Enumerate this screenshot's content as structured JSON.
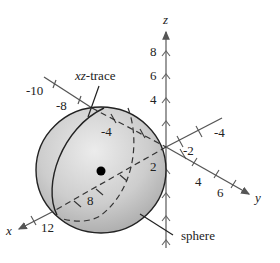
{
  "figure": {
    "type": "3d-coordinate-diagram",
    "labels": {
      "xz_trace": "xz-trace",
      "sphere": "sphere"
    },
    "axes": {
      "x": {
        "label": "x",
        "ticks": [
          "-10",
          "-8",
          "-4",
          "2",
          "8",
          "12"
        ]
      },
      "y": {
        "label": "y",
        "ticks": [
          "-4",
          "-2",
          "2",
          "4",
          "6"
        ]
      },
      "z": {
        "label": "z",
        "ticks": [
          "8",
          "6",
          "4"
        ]
      }
    },
    "colors": {
      "sphere_fill": "#c8c8c8",
      "sphere_highlight": "#e6e6e6",
      "line": "#222222",
      "axis": "#555555",
      "background": "#ffffff"
    }
  }
}
